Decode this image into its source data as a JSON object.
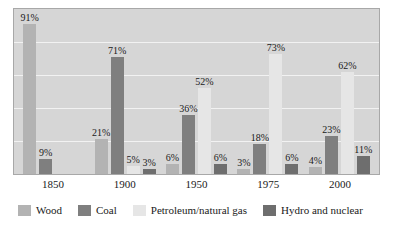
{
  "chart_data": {
    "type": "bar",
    "title": "",
    "subtitle": "",
    "xlabel": "",
    "ylabel": "",
    "ylim": [
      0,
      100
    ],
    "grid": true,
    "gridline_values": [
      20,
      40,
      60,
      80
    ],
    "legend_position": "bottom",
    "value_suffix": "%",
    "categories": [
      "1850",
      "1900",
      "1950",
      "1975",
      "2000"
    ],
    "series": [
      {
        "name": "Wood",
        "color": "#b3b3b3",
        "values": [
          91,
          21,
          6,
          3,
          4
        ],
        "labels": [
          "91%",
          "21%",
          "6%",
          "3%",
          "4%"
        ]
      },
      {
        "name": "Coal",
        "color": "#7f7f7f",
        "values": [
          9,
          71,
          36,
          18,
          23
        ],
        "labels": [
          "9%",
          "71%",
          "36%",
          "18%",
          "23%"
        ]
      },
      {
        "name": "Petroleum/natural gas",
        "color": "#e6e6e6",
        "values": [
          null,
          5,
          52,
          73,
          62
        ],
        "labels": [
          "",
          "5%",
          "52%",
          "73%",
          "62%"
        ]
      },
      {
        "name": "Hydro and nuclear",
        "color": "#6e6e6e",
        "values": [
          null,
          3,
          6,
          6,
          11
        ],
        "labels": [
          "",
          "3%",
          "6%",
          "6%",
          "11%"
        ]
      }
    ]
  },
  "legend": {
    "items": [
      {
        "label": "Wood",
        "key": "wood"
      },
      {
        "label": "Coal",
        "key": "coal"
      },
      {
        "label": "Petroleum/natural gas",
        "key": "petroleum"
      },
      {
        "label": "Hydro and nuclear",
        "key": "hydro"
      }
    ]
  }
}
